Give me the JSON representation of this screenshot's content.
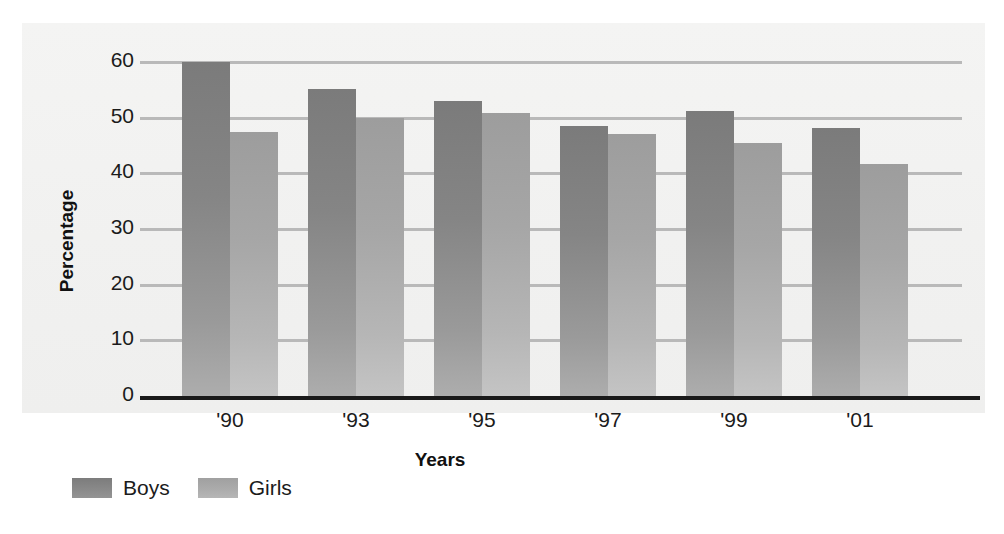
{
  "chart_data": {
    "type": "bar",
    "title": "",
    "subtitle": "",
    "xlabel": "Years",
    "ylabel": "Percentage",
    "categories": [
      "'90",
      "'93",
      "'95",
      "'97",
      "'99",
      "'01"
    ],
    "series": [
      {
        "name": "Boys",
        "color": "#8a8a8a",
        "values": [
          60,
          55.2,
          53,
          48.5,
          51.2,
          48.2
        ]
      },
      {
        "name": "Girls",
        "color": "#acacac",
        "values": [
          47.4,
          50,
          50.8,
          47,
          45.4,
          41.7
        ]
      }
    ],
    "ylim": [
      0,
      60
    ],
    "yticks": [
      0,
      10,
      20,
      30,
      40,
      50,
      60
    ],
    "ytick_labels": [
      "0",
      "10",
      "20",
      "30",
      "40",
      "50",
      "60"
    ],
    "grid": true,
    "grid_axis": "y",
    "legend_position": "bottom-left",
    "legend_entries": [
      "Boys",
      "Girls"
    ],
    "background_color": "#f2f2f1",
    "axis_color": "#1a1a1a",
    "gridline_color": "#b9b9b9"
  }
}
